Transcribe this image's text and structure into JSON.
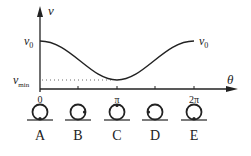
{
  "axes": {
    "y_label": "v",
    "x_label": "θ",
    "y_ticks": [
      {
        "label": "v",
        "sub": "0"
      },
      {
        "label": "v",
        "sub": "min"
      }
    ],
    "x_ticks": [
      "0",
      "π",
      "2π"
    ],
    "right_label": {
      "label": "v",
      "sub": "0"
    }
  },
  "positions": [
    {
      "label": "A",
      "dot": "bottom"
    },
    {
      "label": "B",
      "dot": "right"
    },
    {
      "label": "C",
      "dot": "top"
    },
    {
      "label": "D",
      "dot": "left"
    },
    {
      "label": "E",
      "dot": "bottom"
    }
  ],
  "colors": {
    "ink": "#222222",
    "background": "#ffffff"
  }
}
